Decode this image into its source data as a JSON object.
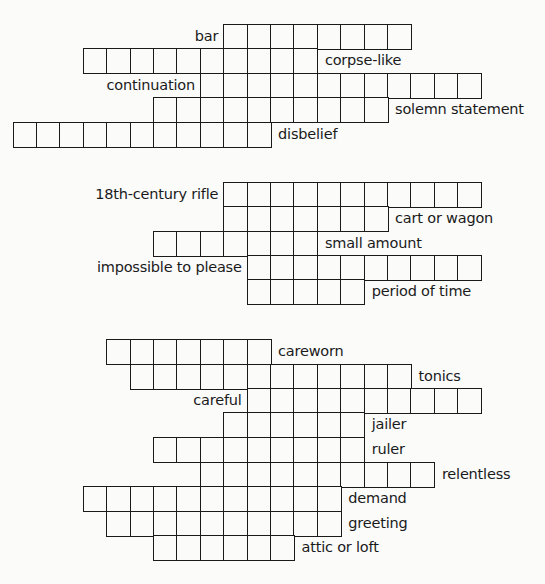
{
  "grid": {
    "origin_x": 12.7,
    "cell_w": 23.4,
    "cell_h": 24.4,
    "line_color": "#1a1a1a",
    "background": "#fbfbfa"
  },
  "blocks": [
    {
      "rows": [
        {
          "clue": "bar",
          "label_side": "left",
          "top": 24,
          "col_start": 9,
          "length": 8
        },
        {
          "clue": "corpse-like",
          "label_side": "right",
          "top": 48,
          "col_start": 3,
          "length": 10
        },
        {
          "clue": "continuation",
          "label_side": "left",
          "top": 73,
          "col_start": 8,
          "length": 12
        },
        {
          "clue": "solemn statement",
          "label_side": "right",
          "top": 97,
          "col_start": 6,
          "length": 10
        },
        {
          "clue": "disbelief",
          "label_side": "right",
          "top": 122,
          "col_start": 0,
          "length": 11
        }
      ]
    },
    {
      "rows": [
        {
          "clue": "18th-century rifle",
          "label_side": "left",
          "top": 182,
          "col_start": 9,
          "length": 11
        },
        {
          "clue": "cart or wagon",
          "label_side": "right",
          "top": 206,
          "col_start": 9,
          "length": 7
        },
        {
          "clue": "small amount",
          "label_side": "right",
          "top": 231,
          "col_start": 6,
          "length": 7
        },
        {
          "clue": "impossible to please",
          "label_side": "left",
          "top": 255,
          "col_start": 10,
          "length": 10
        },
        {
          "clue": "period of time",
          "label_side": "right",
          "top": 279,
          "col_start": 10,
          "length": 5
        }
      ]
    },
    {
      "rows": [
        {
          "clue": "careworn",
          "label_side": "right",
          "top": 339,
          "col_start": 4,
          "length": 7
        },
        {
          "clue": "tonics",
          "label_side": "right",
          "top": 364,
          "col_start": 5,
          "length": 12
        },
        {
          "clue": "careful",
          "label_side": "left",
          "top": 388,
          "col_start": 10,
          "length": 10
        },
        {
          "clue": "jailer",
          "label_side": "right",
          "top": 412,
          "col_start": 9,
          "length": 6
        },
        {
          "clue": "ruler",
          "label_side": "right",
          "top": 437,
          "col_start": 6,
          "length": 9
        },
        {
          "clue": "relentless",
          "label_side": "right",
          "top": 462,
          "col_start": 8,
          "length": 10
        },
        {
          "clue": "demand",
          "label_side": "right",
          "top": 486,
          "col_start": 3,
          "length": 11
        },
        {
          "clue": "greeting",
          "label_side": "right",
          "top": 511,
          "col_start": 4,
          "length": 10
        },
        {
          "clue": "attic or loft",
          "label_side": "right",
          "top": 535,
          "col_start": 6,
          "length": 6
        }
      ]
    }
  ]
}
